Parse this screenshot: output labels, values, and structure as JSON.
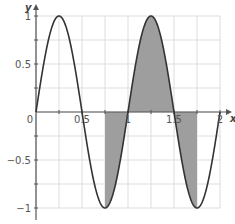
{
  "chart_data": {
    "type": "line",
    "title": "",
    "function": "y = sin(2πx)",
    "xlabel": "x",
    "ylabel": "y",
    "xlim": [
      0,
      2
    ],
    "ylim": [
      -1,
      1
    ],
    "grid": true,
    "x_ticks": [
      0,
      0.5,
      1,
      1.5,
      2
    ],
    "x_tick_labels": [
      "0",
      "0.5",
      "1",
      "1.5",
      "2"
    ],
    "y_ticks": [
      -1,
      -0.5,
      0.5,
      1
    ],
    "y_tick_labels": [
      "−1",
      "−0.5",
      "0.5",
      "1"
    ],
    "grid_step_x": 0.25,
    "grid_step_y": 0.25,
    "series": [
      {
        "name": "sin(2πx)",
        "x": [
          0,
          0.25,
          0.5,
          0.75,
          1,
          1.25,
          1.5,
          1.75,
          2
        ],
        "y": [
          0,
          1,
          0,
          -1,
          0,
          1,
          0,
          -1,
          0
        ]
      }
    ],
    "shaded_regions": [
      {
        "x_from": 0.75,
        "x_to": 1.0,
        "side": "below axis"
      },
      {
        "x_from": 1.0,
        "x_to": 1.5,
        "side": "above axis"
      },
      {
        "x_from": 1.5,
        "x_to": 1.75,
        "side": "below axis"
      }
    ],
    "colors": {
      "curve": "#333333",
      "shade": "#9e9e9e",
      "grid": "#dddddd",
      "axis": "#555555"
    }
  }
}
